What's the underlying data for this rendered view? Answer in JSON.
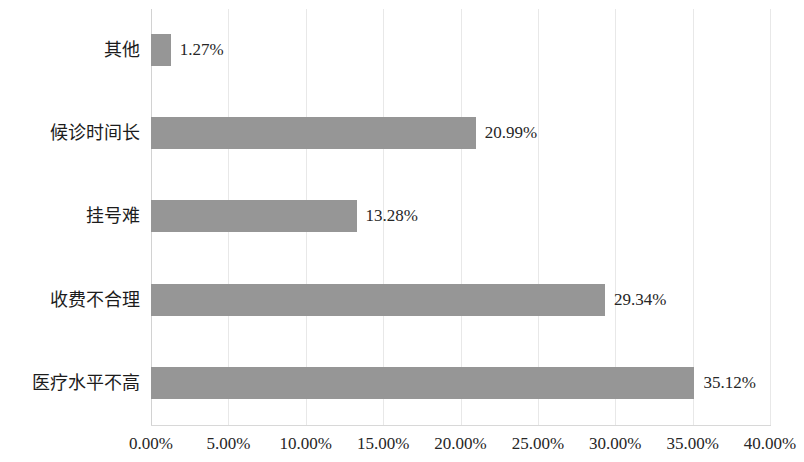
{
  "chart_data": {
    "type": "bar",
    "orientation": "horizontal",
    "title": "",
    "xlabel": "",
    "ylabel": "",
    "categories": [
      "其他",
      "候诊时间长",
      "挂号难",
      "收费不合理",
      "医疗水平不高"
    ],
    "values": [
      1.27,
      20.99,
      13.28,
      29.34,
      35.12
    ],
    "value_labels": [
      "1.27%",
      "20.99%",
      "13.28%",
      "29.34%",
      "35.12%"
    ],
    "xlim": [
      0,
      40
    ],
    "xticks": [
      0,
      5,
      10,
      15,
      20,
      25,
      30,
      35,
      40
    ],
    "xtick_labels": [
      "0.00%",
      "5.00%",
      "10.00%",
      "15.00%",
      "20.00%",
      "25.00%",
      "30.00%",
      "35.00%",
      "40.00%"
    ],
    "grid": "vertical",
    "legend": "none",
    "bar_color": "#969696",
    "gridline_color": "#e8e8e8",
    "text_color": "#262626"
  },
  "axis": {
    "x_tick_labels": [
      "0.00%",
      "5.00%",
      "10.00%",
      "15.00%",
      "20.00%",
      "25.00%",
      "30.00%",
      "35.00%",
      "40.00%"
    ]
  },
  "series": {
    "bars": [
      {
        "category": "其他",
        "value": 1.27,
        "label": "1.27%"
      },
      {
        "category": "候诊时间长",
        "value": 20.99,
        "label": "20.99%"
      },
      {
        "category": "挂号难",
        "value": 13.28,
        "label": "13.28%"
      },
      {
        "category": "收费不合理",
        "value": 29.34,
        "label": "29.34%"
      },
      {
        "category": "医疗水平不高",
        "value": 35.12,
        "label": "35.12%"
      }
    ]
  }
}
